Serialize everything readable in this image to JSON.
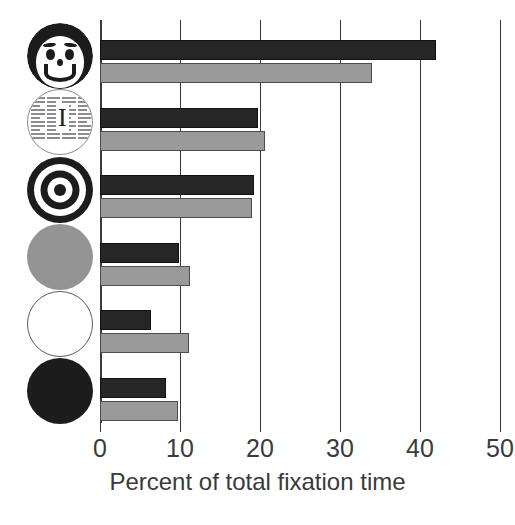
{
  "chart_data": {
    "type": "bar",
    "orientation": "horizontal",
    "title": "",
    "xlabel": "Percent of total fixation time",
    "ylabel": "",
    "xlim": [
      0,
      50
    ],
    "xticks": [
      0,
      10,
      20,
      30,
      40,
      50
    ],
    "xtick_labels": [
      "0",
      "10",
      "20",
      "30",
      "40",
      "50"
    ],
    "grid": "vertical gridlines at each x tick",
    "legend": "none",
    "categories": [
      "face",
      "newsprint",
      "bullseye",
      "gray-disc",
      "white-disc",
      "black-disc"
    ],
    "category_icons": [
      "smiling-face-icon",
      "newsprint-text-circle-icon",
      "bullseye-target-icon",
      "gray-filled-circle-icon",
      "white-outline-circle-icon",
      "black-filled-circle-icon"
    ],
    "series": [
      {
        "name": "dark",
        "color": "#262626",
        "values": [
          42.0,
          19.8,
          19.2,
          9.9,
          6.4,
          8.2
        ]
      },
      {
        "name": "light",
        "color": "#9a9a9a",
        "values": [
          34.0,
          20.6,
          19.0,
          11.3,
          11.1,
          9.7
        ]
      }
    ],
    "bar_rows": [
      {
        "category": "face",
        "dark": 42.0,
        "light": 34.0
      },
      {
        "category": "newsprint",
        "dark": 19.8,
        "light": 20.6
      },
      {
        "category": "bullseye",
        "dark": 19.2,
        "light": 19.0
      },
      {
        "category": "gray-disc",
        "dark": 9.9,
        "light": 11.3
      },
      {
        "category": "white-disc",
        "dark": 6.4,
        "light": 11.1
      },
      {
        "category": "black-disc",
        "dark": 8.2,
        "light": 9.7
      }
    ]
  },
  "axis": {
    "x_title": "Percent of total fixation time",
    "ticks": [
      "0",
      "10",
      "20",
      "30",
      "40",
      "50"
    ]
  },
  "icons": {
    "news_dropcap": "I"
  },
  "colors": {
    "dark_bar": "#262626",
    "light_bar": "#9a9a9a",
    "axis": "#3a3a3a",
    "background": "#ffffff"
  }
}
